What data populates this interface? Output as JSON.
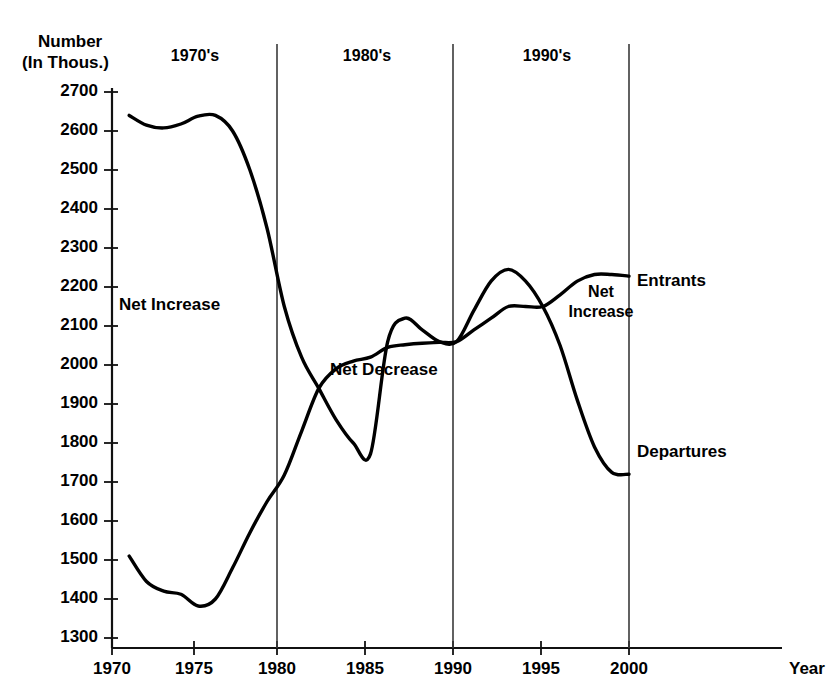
{
  "chart_data": {
    "type": "line",
    "title": "",
    "ylabel_lines": [
      "Number",
      "(In Thous.)"
    ],
    "xlabel": "Year",
    "xlim": [
      1970,
      2000
    ],
    "ylim": [
      1300,
      2700
    ],
    "grid": false,
    "legend_position": "right-inline",
    "ytick_labels": [
      "2700",
      "2600",
      "2500",
      "2400",
      "2300",
      "2200",
      "2100",
      "2000",
      "1900",
      "1800",
      "1700",
      "1600",
      "1500",
      "1400",
      "1300"
    ],
    "ytick_values": [
      2700,
      2600,
      2500,
      2400,
      2300,
      2200,
      2100,
      2000,
      1900,
      1800,
      1700,
      1600,
      1500,
      1400,
      1300
    ],
    "xtick_labels": [
      "1970",
      "1975",
      "1980",
      "1985",
      "1990",
      "1995",
      "2000"
    ],
    "xtick_values": [
      1970,
      1975,
      1980,
      1985,
      1990,
      1995,
      2000
    ],
    "series": [
      {
        "name": "Entrants",
        "x": [
          1971,
          1972,
          1973,
          1974,
          1975,
          1976,
          1977,
          1978,
          1979,
          1980,
          1981,
          1982,
          1983,
          1984,
          1985,
          1986,
          1987,
          1988,
          1989,
          1990,
          1991,
          1992,
          1993,
          1994,
          1995,
          1996,
          1997,
          1998,
          1999,
          2000
        ],
        "values": [
          2640,
          2615,
          2608,
          2618,
          2638,
          2640,
          2600,
          2500,
          2350,
          2150,
          2020,
          1940,
          1860,
          1800,
          1772,
          2060,
          2120,
          2090,
          2060,
          2060,
          2140,
          2215,
          2245,
          2215,
          2150,
          2050,
          1910,
          1790,
          1725,
          1720
        ]
      },
      {
        "name": "Departures",
        "x": [
          1971,
          1972,
          1973,
          1974,
          1975,
          1976,
          1977,
          1978,
          1979,
          1980,
          1981,
          1982,
          1983,
          1984,
          1985,
          1986,
          1987,
          1988,
          1989,
          1990,
          1991,
          1992,
          1993,
          1994,
          1995,
          1996,
          1997,
          1998,
          1999,
          2000
        ],
        "values": [
          1510,
          1445,
          1420,
          1412,
          1382,
          1400,
          1480,
          1570,
          1650,
          1718,
          1830,
          1940,
          1990,
          2010,
          2020,
          2045,
          2052,
          2056,
          2058,
          2060,
          2090,
          2120,
          2150,
          2150,
          2150,
          2180,
          2215,
          2232,
          2232,
          2228
        ]
      }
    ],
    "annotations": [
      {
        "text": "Net Increase",
        "x": 1973.5,
        "y": 2130
      },
      {
        "text": "Net Decrease",
        "x": 1985.0,
        "y": 1945
      },
      {
        "text": "Net\nIncrease",
        "x": 1996.3,
        "y": 2110
      }
    ],
    "decade_labels": [
      "1970's",
      "1980's",
      "1990's"
    ],
    "decade_divider_values": [
      1980,
      1990,
      2000
    ],
    "series_labels": [
      "Entrants",
      "Departures"
    ]
  },
  "axis": {
    "y_title_line1": "Number",
    "y_title_line2": "(In Thous.)",
    "x_title": "Year"
  },
  "colors": {
    "line": "#000000",
    "axis": "#111111",
    "divider": "#3a3a3a",
    "background": "#ffffff"
  }
}
